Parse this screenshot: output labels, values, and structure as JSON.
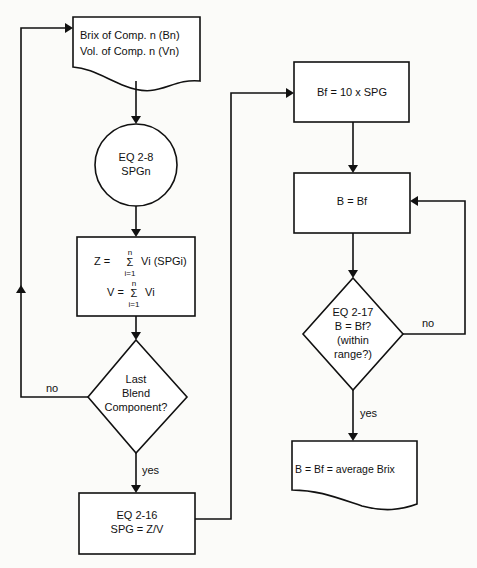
{
  "nodes": {
    "input_doc": {
      "line1": "Brix of Comp. n  (Bn)",
      "line2": "Vol. of Comp. n  (Vn)"
    },
    "eq28": {
      "line1": "EQ 2-8",
      "line2": "SPGn"
    },
    "sums": {
      "z_lhs": "Z =",
      "z_sigma": "Σ",
      "z_top": "n",
      "z_bottom": "i=1",
      "z_rhs": "Vi (SPGi)",
      "v_lhs": "V =",
      "v_sigma": "Σ",
      "v_top": "n",
      "v_bottom": "i=1",
      "v_rhs": "Vi"
    },
    "decision1": {
      "line1": "Last",
      "line2": "Blend",
      "line3": "Component?"
    },
    "eq216": {
      "line1": "EQ 2-16",
      "line2": "SPG = Z/V"
    },
    "bf": {
      "label": "Bf = 10 x SPG"
    },
    "b_eq_bf": {
      "label": "B = Bf"
    },
    "decision2": {
      "line1": "EQ 2-17",
      "line2": "B = Bf?",
      "line3": "(within",
      "line4": "range?)"
    },
    "output_doc": {
      "label": "B = Bf = average Brix"
    }
  },
  "edges": {
    "decision1_no": "no",
    "decision1_yes": "yes",
    "decision2_no": "no",
    "decision2_yes": "yes"
  }
}
